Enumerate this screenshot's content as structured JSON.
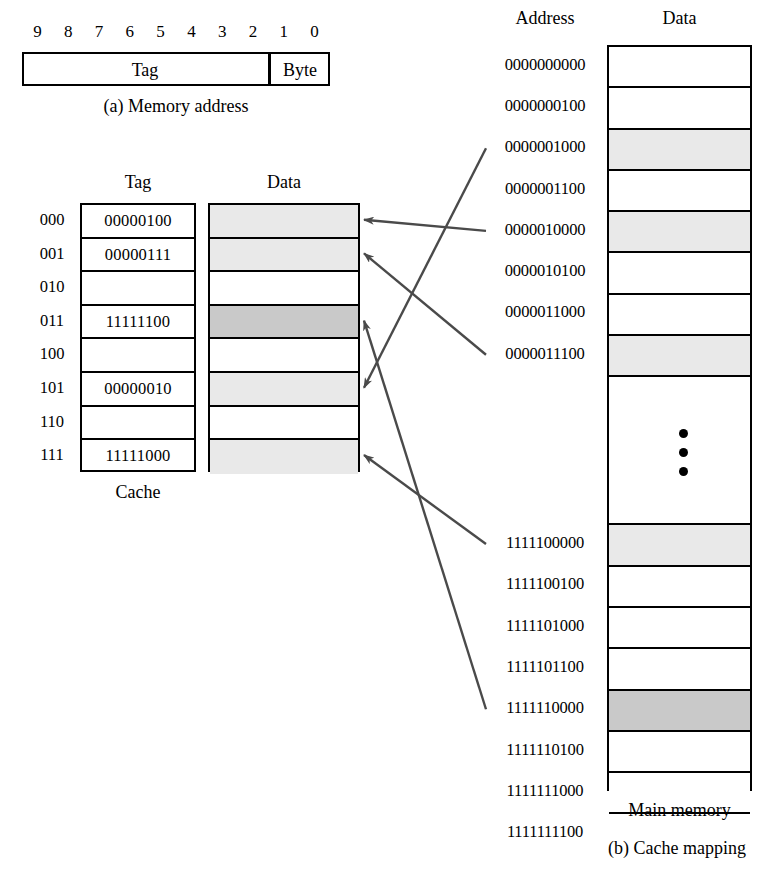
{
  "figure": {
    "caption_a": "(a) Memory address",
    "caption_b": "(b) Cache mapping"
  },
  "address_field": {
    "bits": [
      "9",
      "8",
      "7",
      "6",
      "5",
      "4",
      "3",
      "2",
      "1",
      "0"
    ],
    "tag_label": "Tag",
    "byte_label": "Byte"
  },
  "cache": {
    "caption": "Cache",
    "tag_header": "Tag",
    "data_header": "Data",
    "rows": [
      {
        "index": "000",
        "tag": "00000100",
        "shade": "light"
      },
      {
        "index": "001",
        "tag": "00000111",
        "shade": "light"
      },
      {
        "index": "010",
        "tag": "",
        "shade": "none"
      },
      {
        "index": "011",
        "tag": "11111100",
        "shade": "dark"
      },
      {
        "index": "100",
        "tag": "",
        "shade": "none"
      },
      {
        "index": "101",
        "tag": "00000010",
        "shade": "light"
      },
      {
        "index": "110",
        "tag": "",
        "shade": "none"
      },
      {
        "index": "111",
        "tag": "11111000",
        "shade": "light"
      }
    ]
  },
  "main_memory": {
    "caption": "Main memory",
    "address_header": "Address",
    "data_header": "Data",
    "rows": [
      {
        "address": "0000000000",
        "shade": "none"
      },
      {
        "address": "0000000100",
        "shade": "none"
      },
      {
        "address": "0000001000",
        "shade": "light"
      },
      {
        "address": "0000001100",
        "shade": "none"
      },
      {
        "address": "0000010000",
        "shade": "light"
      },
      {
        "address": "0000010100",
        "shade": "none"
      },
      {
        "address": "0000011000",
        "shade": "none"
      },
      {
        "address": "0000011100",
        "shade": "light"
      },
      {
        "address": "",
        "shade": "none",
        "ellipsis": true
      },
      {
        "address": "1111100000",
        "shade": "light"
      },
      {
        "address": "1111100100",
        "shade": "none"
      },
      {
        "address": "1111101000",
        "shade": "none"
      },
      {
        "address": "1111101100",
        "shade": "none"
      },
      {
        "address": "1111110000",
        "shade": "dark"
      },
      {
        "address": "1111110100",
        "shade": "none"
      },
      {
        "address": "1111111000",
        "shade": "none"
      },
      {
        "address": "1111111100",
        "shade": "none"
      }
    ]
  },
  "mapping_arrows": [
    {
      "from_address": "0000001000",
      "to_cache_index": "101"
    },
    {
      "from_address": "0000010000",
      "to_cache_index": "000"
    },
    {
      "from_address": "0000011100",
      "to_cache_index": "001"
    },
    {
      "from_address": "1111100000",
      "to_cache_index": "111"
    },
    {
      "from_address": "1111110000",
      "to_cache_index": "011"
    }
  ],
  "colors": {
    "shade_light": "#e9e9e9",
    "shade_dark": "#c9c9c9",
    "line": "#000000",
    "arrow": "#4a4a4a",
    "background": "#ffffff"
  }
}
